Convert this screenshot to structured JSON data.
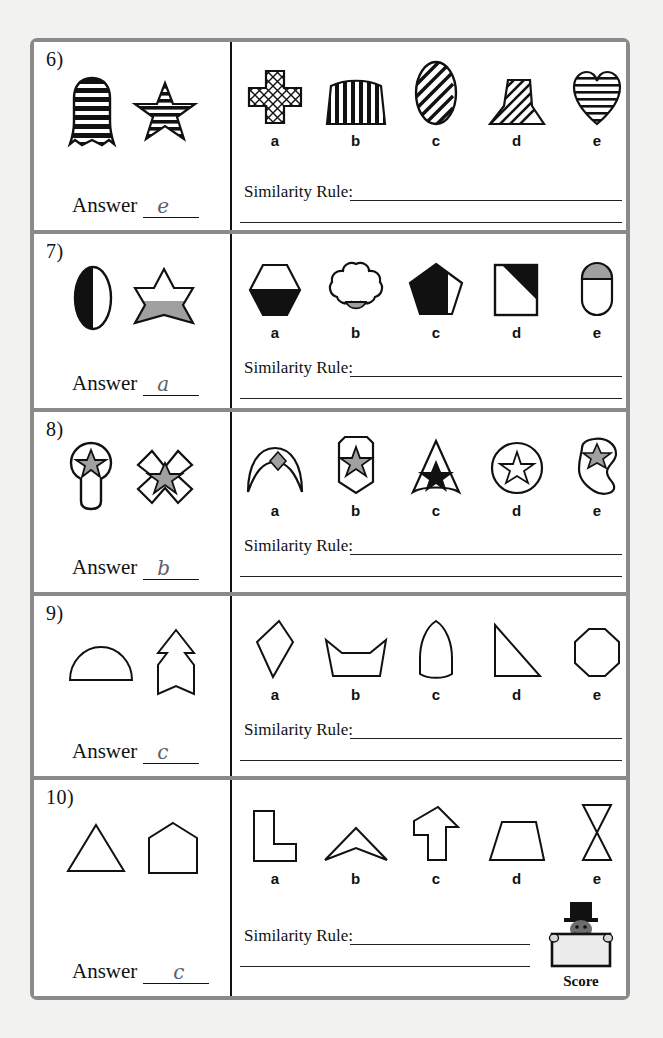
{
  "worksheet": {
    "answer_label": "Answer",
    "similarity_rule_label": "Similarity Rule:",
    "score_label": "Score",
    "option_letters": [
      "a",
      "b",
      "c",
      "d",
      "e"
    ],
    "colors": {
      "page_background": "#f2f2f0",
      "sheet_background": "#ffffff",
      "border_gray": "#8a8a8a",
      "ink_black": "#111111",
      "shape_gray_fill": "#a0a0a0",
      "handwriting_gray": "#5d6068"
    }
  },
  "questions": [
    {
      "number": "6)",
      "stimuli": [
        "horizontally-striped-dome-pillar-shape",
        "horizontally-striped-five-point-star"
      ],
      "options": [
        {
          "letter": "a",
          "shape": "cross-with-crosshatch-fill"
        },
        {
          "letter": "b",
          "shape": "arched-bridge-with-vertical-stripes"
        },
        {
          "letter": "c",
          "shape": "ellipse-with-diagonal-stripes"
        },
        {
          "letter": "d",
          "shape": "flared-pedestal-with-diagonal-stripes"
        },
        {
          "letter": "e",
          "shape": "heart-with-horizontal-stripes"
        }
      ],
      "answer": "e",
      "similarity_rule_value": ""
    },
    {
      "number": "7)",
      "stimuli": [
        "ellipse-half-black-left",
        "six-point-star-lower-half-gray"
      ],
      "options": [
        {
          "letter": "a",
          "shape": "hexagon-bottom-half-black"
        },
        {
          "letter": "b",
          "shape": "cloud-shape-bottom-gray"
        },
        {
          "letter": "c",
          "shape": "pentagon-mostly-black"
        },
        {
          "letter": "d",
          "shape": "square-upper-right-black-triangle"
        },
        {
          "letter": "e",
          "shape": "capsule-top-section-gray"
        }
      ],
      "answer": "a",
      "similarity_rule_value": ""
    },
    {
      "number": "8)",
      "stimuli": [
        "keyhole-shape-with-gray-star",
        "x-cross-shape-with-gray-star"
      ],
      "options": [
        {
          "letter": "a",
          "shape": "crescent-arch-with-gray-diamond"
        },
        {
          "letter": "b",
          "shape": "banner-pennant-with-gray-star"
        },
        {
          "letter": "c",
          "shape": "triangle-with-black-star"
        },
        {
          "letter": "d",
          "shape": "circle-with-white-star"
        },
        {
          "letter": "e",
          "shape": "blob-shape-with-gray-star"
        }
      ],
      "answer": "b",
      "similarity_rule_value": ""
    },
    {
      "number": "9)",
      "stimuli": [
        "semicircle-dome-outline",
        "arrow-banner-outline"
      ],
      "options": [
        {
          "letter": "a",
          "shape": "kite-diamond-outline"
        },
        {
          "letter": "b",
          "shape": "open-bowl-trapezoid-outline"
        },
        {
          "letter": "c",
          "shape": "bullet-dome-outline"
        },
        {
          "letter": "d",
          "shape": "right-triangle-outline"
        },
        {
          "letter": "e",
          "shape": "octagon-outline"
        }
      ],
      "answer": "c",
      "similarity_rule_value": ""
    },
    {
      "number": "10)",
      "stimuli": [
        "triangle-outline",
        "house-pentagon-outline"
      ],
      "options": [
        {
          "letter": "a",
          "shape": "l-shape-outline"
        },
        {
          "letter": "b",
          "shape": "chevron-arrowhead-outline"
        },
        {
          "letter": "c",
          "shape": "up-arrow-outline"
        },
        {
          "letter": "d",
          "shape": "trapezoid-outline"
        },
        {
          "letter": "e",
          "shape": "hourglass-bowtie-outline"
        }
      ],
      "answer": "c",
      "similarity_rule_value": ""
    }
  ]
}
